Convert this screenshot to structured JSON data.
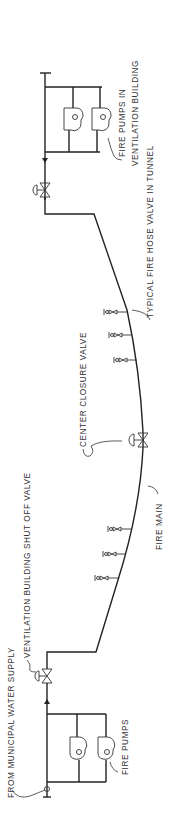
{
  "diagram": {
    "orientation": "rotated 90° counter-clockwise",
    "colors": {
      "line": "#222222",
      "text": "#333333",
      "background": "#ffffff"
    },
    "labels": {
      "municipal_supply": "FROM MUNICIPAL WATER SUPPLY",
      "shutoff_valve": "VENTILATION BUILDING SHUT OFF VALVE",
      "fire_pumps": "FIRE PUMPS",
      "fire_main": "FIRE MAIN",
      "center_valve": "CENTER CLOSURE VALVE",
      "hose_valve": "TYPICAL FIRE HOSE VALVE IN TUNNEL",
      "fire_pumps_vent_line1": "FIRE PUMPS IN",
      "fire_pumps_vent_line2": "VENTILATION BUILDING"
    },
    "components": [
      {
        "id": "pump-station-a",
        "type": "pump-pair",
        "count": 2
      },
      {
        "id": "shutoff-valve-a",
        "type": "gate-valve"
      },
      {
        "id": "hose-valves-a",
        "type": "hose-valve",
        "count": 3
      },
      {
        "id": "center-closure-valve",
        "type": "gate-valve"
      },
      {
        "id": "hose-valves-b",
        "type": "hose-valve",
        "count": 3
      },
      {
        "id": "shutoff-valve-b",
        "type": "gate-valve"
      },
      {
        "id": "pump-station-b",
        "type": "pump-pair",
        "count": 2
      }
    ]
  }
}
